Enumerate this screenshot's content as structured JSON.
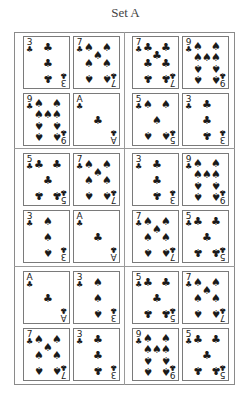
{
  "title": "Set A",
  "suits": {
    "club": "♣",
    "spade": "♠"
  },
  "groups": [
    {
      "name": "group-1-left",
      "cards": [
        {
          "rank": "3",
          "suit": "club",
          "index_suit": "club"
        },
        {
          "rank": "7",
          "suit": "spade",
          "index_suit": "club"
        },
        {
          "rank": "9",
          "suit": "spade",
          "index_suit": "club"
        },
        {
          "rank": "A",
          "suit": "club",
          "index_suit": "club"
        }
      ]
    },
    {
      "name": "group-1-right",
      "cards": [
        {
          "rank": "7",
          "suit": "club",
          "index_suit": "club"
        },
        {
          "rank": "9",
          "suit": "spade",
          "index_suit": "club"
        },
        {
          "rank": "5",
          "suit": "spade",
          "index_suit": "club"
        },
        {
          "rank": "3",
          "suit": "club",
          "index_suit": "club"
        }
      ]
    },
    {
      "name": "group-2-left",
      "cards": [
        {
          "rank": "5",
          "suit": "club",
          "index_suit": "club"
        },
        {
          "rank": "7",
          "suit": "spade",
          "index_suit": "club"
        },
        {
          "rank": "3",
          "suit": "spade",
          "index_suit": "club"
        },
        {
          "rank": "A",
          "suit": "club",
          "index_suit": "club"
        }
      ]
    },
    {
      "name": "group-2-right",
      "cards": [
        {
          "rank": "3",
          "suit": "club",
          "index_suit": "club"
        },
        {
          "rank": "9",
          "suit": "spade",
          "index_suit": "club"
        },
        {
          "rank": "7",
          "suit": "spade",
          "index_suit": "club"
        },
        {
          "rank": "5",
          "suit": "club",
          "index_suit": "club"
        }
      ]
    },
    {
      "name": "group-3-left",
      "cards": [
        {
          "rank": "A",
          "suit": "club",
          "index_suit": "club"
        },
        {
          "rank": "3",
          "suit": "spade",
          "index_suit": "club"
        },
        {
          "rank": "7",
          "suit": "spade",
          "index_suit": "club"
        },
        {
          "rank": "3",
          "suit": "club",
          "index_suit": "club"
        }
      ]
    },
    {
      "name": "group-3-right",
      "cards": [
        {
          "rank": "5",
          "suit": "club",
          "index_suit": "club"
        },
        {
          "rank": "7",
          "suit": "spade",
          "index_suit": "club"
        },
        {
          "rank": "9",
          "suit": "spade",
          "index_suit": "club"
        },
        {
          "rank": "5",
          "suit": "club",
          "index_suit": "club"
        }
      ]
    }
  ]
}
